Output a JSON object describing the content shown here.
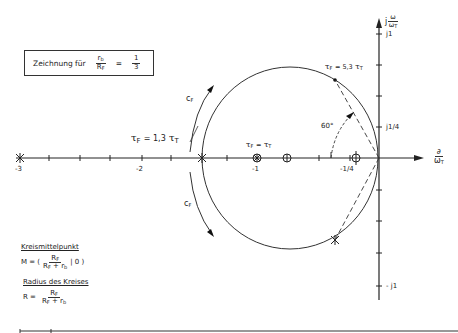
{
  "box": {
    "prefix": "Zeichnung für",
    "ratio_num": "r",
    "ratio_num_sub": "b",
    "ratio_den": "R",
    "ratio_den_sub": "F",
    "equals": "=",
    "value_num": "1",
    "value_den": "3"
  },
  "axes": {
    "y_label_prefix": "j",
    "y_label_num": "ω",
    "y_label_den": "ω",
    "y_label_den_sub": "T",
    "x_label_num": "∂",
    "x_label_den": "ω",
    "x_label_den_sub": "T",
    "y_ticks": {
      "top": "j1",
      "quarter": "j1/4",
      "bottom": "- j1"
    },
    "x_ticks": {
      "m3": "-3",
      "m2": "-2",
      "m1": "-1",
      "mquarter": "-1/4"
    }
  },
  "annotations": {
    "tau_upper": {
      "t": "τ",
      "sub": "F",
      "eq": "= 5,3",
      "t2": "τ",
      "sub2": "T"
    },
    "tau_left": {
      "t": "τ",
      "sub": "F",
      "eq": "= 1,3",
      "t2": "τ",
      "sub2": "T"
    },
    "tau_mid": {
      "t": "τ",
      "sub": "F",
      "eq": "=",
      "t2": "τ",
      "sub2": "T"
    },
    "angle": "60°",
    "cf_upper": {
      "c": "c",
      "sub": "F"
    },
    "cf_lower": {
      "c": "c",
      "sub": "F"
    }
  },
  "legend": {
    "center_title": "Kreismittelpunkt",
    "center_lhs": "M = (",
    "center_num": "R",
    "center_num_sub": "F",
    "center_den": "R",
    "center_den_sub": "F",
    "center_den_tail": " + r",
    "center_den_tail_sub": "b",
    "center_rhs": "| 0 )",
    "radius_title": "Radius des Kreises",
    "radius_lhs": "R =",
    "radius_num": "R",
    "radius_num_sub": "F",
    "radius_den": "R",
    "radius_den_sub": "F",
    "radius_den_tail": " + r",
    "radius_den_tail_sub": "b"
  }
}
